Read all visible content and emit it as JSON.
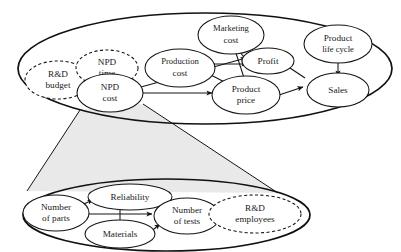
{
  "diagram": {
    "type": "causal-loop-diagram",
    "background_color": "#ffffff",
    "stroke_color": "#141414",
    "cone_fill_color": "#e9e9e9",
    "boundaries": [
      {
        "id": "top-system-boundary",
        "name": "top-system-boundary",
        "style": "solid"
      },
      {
        "id": "bottom-system-boundary",
        "name": "bottom-system-boundary",
        "style": "solid"
      }
    ],
    "nodes": [
      {
        "id": "rd-budget",
        "label_line1": "R&D",
        "label_line2": "budget",
        "style": "dashed",
        "group": "top"
      },
      {
        "id": "npd-time",
        "label_line1": "NPD",
        "label_line2": "time",
        "style": "dashed",
        "group": "top"
      },
      {
        "id": "npd-cost",
        "label_line1": "NPD",
        "label_line2": "cost",
        "style": "solid",
        "group": "top"
      },
      {
        "id": "production-cost",
        "label_line1": "Production",
        "label_line2": "cost",
        "style": "solid",
        "group": "top"
      },
      {
        "id": "marketing-cost",
        "label_line1": "Marketing",
        "label_line2": "cost",
        "style": "solid",
        "group": "top"
      },
      {
        "id": "profit",
        "label_line1": "Profit",
        "label_line2": "",
        "style": "solid",
        "group": "top"
      },
      {
        "id": "product-life-cycle",
        "label_line1": "Product",
        "label_line2": "life cycle",
        "style": "solid",
        "group": "top"
      },
      {
        "id": "product-price",
        "label_line1": "Product",
        "label_line2": "price",
        "style": "solid",
        "group": "top"
      },
      {
        "id": "sales",
        "label_line1": "Sales",
        "label_line2": "",
        "style": "solid",
        "group": "top"
      },
      {
        "id": "number-of-parts",
        "label_line1": "Number",
        "label_line2": "of parts",
        "style": "solid",
        "group": "bottom"
      },
      {
        "id": "reliability",
        "label_line1": "Reliability",
        "label_line2": "",
        "style": "solid",
        "group": "bottom"
      },
      {
        "id": "materials",
        "label_line1": "Materials",
        "label_line2": "",
        "style": "solid",
        "group": "bottom"
      },
      {
        "id": "number-of-tests",
        "label_line1": "Number",
        "label_line2": "of tests",
        "style": "solid",
        "group": "bottom"
      },
      {
        "id": "rd-employees",
        "label_line1": "R&D",
        "label_line2": "employees",
        "style": "dashed",
        "group": "bottom"
      }
    ],
    "edges": [
      {
        "from": "npd-cost",
        "to": "product-price"
      },
      {
        "from": "npd-cost",
        "to": "profit"
      },
      {
        "from": "production-cost",
        "to": "profit"
      },
      {
        "from": "production-cost",
        "to": "product-price"
      },
      {
        "from": "marketing-cost",
        "to": "profit"
      },
      {
        "from": "marketing-cost",
        "to": "product-price"
      },
      {
        "from": "product-price",
        "to": "sales"
      },
      {
        "from": "sales",
        "to": "profit"
      },
      {
        "from": "product-life-cycle",
        "to": "sales"
      },
      {
        "from": "number-of-parts",
        "to": "reliability"
      },
      {
        "from": "number-of-parts",
        "to": "number-of-tests"
      },
      {
        "from": "materials",
        "to": "reliability"
      },
      {
        "from": "materials",
        "to": "number-of-tests"
      },
      {
        "from": "number-of-tests",
        "to": "reliability"
      }
    ],
    "magnifier": {
      "name": "magnifier-cone",
      "source_node": "npd-cost",
      "target_boundary": "bottom-system-boundary"
    }
  }
}
